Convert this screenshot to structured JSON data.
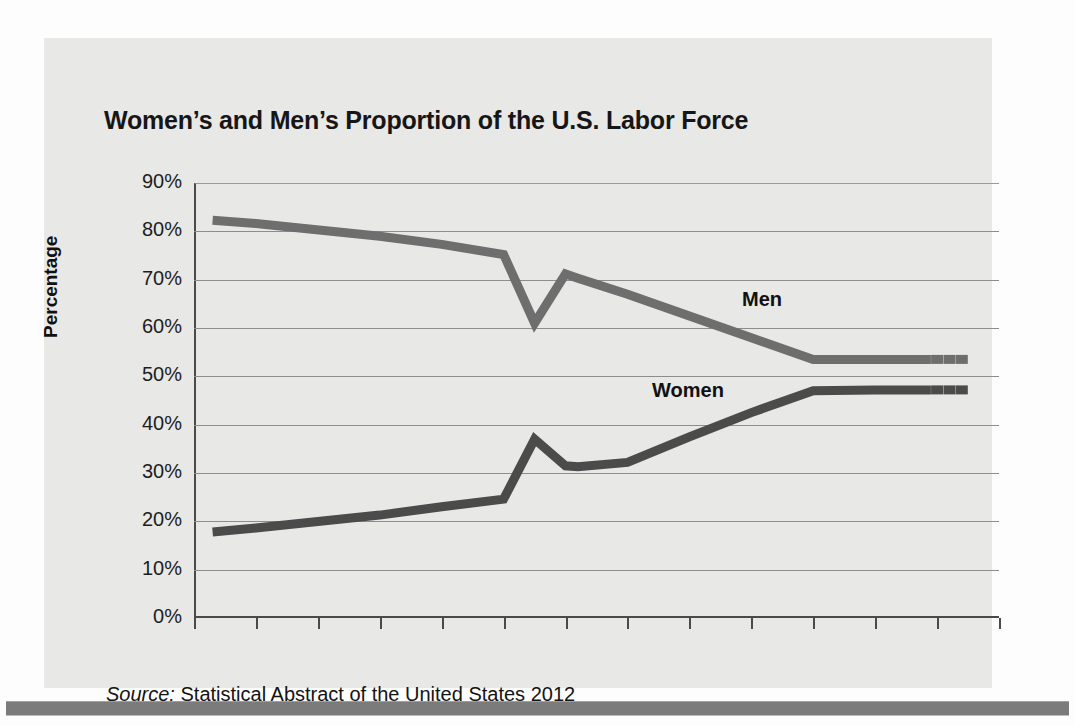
{
  "chart_data": {
    "type": "line",
    "title": "Women’s and Men’s Proportion of the U.S. Labor Force",
    "xlabel": "Year",
    "ylabel": "Percentage",
    "xlim": [
      1890,
      2020
    ],
    "ylim": [
      0,
      90
    ],
    "grid": true,
    "legend_position": "inline-annotation",
    "x_tick_labels": [
      "1890",
      "1900",
      "1910",
      "1920",
      "1930",
      "1940",
      "1950",
      "1960",
      "1970",
      "1980",
      "1990",
      "2000",
      "2010",
      "2020"
    ],
    "x_ticks": [
      1890,
      1900,
      1910,
      1920,
      1930,
      1940,
      1950,
      1960,
      1970,
      1980,
      1990,
      2000,
      2010,
      2020
    ],
    "y_tick_labels": [
      "0%",
      "10%",
      "20%",
      "30%",
      "40%",
      "50%",
      "60%",
      "70%",
      "80%",
      "90%"
    ],
    "y_ticks": [
      0,
      10,
      20,
      30,
      40,
      50,
      60,
      70,
      80,
      90
    ],
    "series": [
      {
        "name": "Men",
        "color": "#6e6e6e",
        "x": [
          1893,
          1900,
          1920,
          1930,
          1940,
          1945,
          1950,
          1952,
          1960,
          1970,
          1980,
          1990,
          2000,
          2009
        ],
        "values": [
          82.3,
          81.6,
          79.0,
          77.3,
          75.2,
          61.0,
          71.2,
          70.3,
          67.0,
          62.5,
          58.0,
          53.5,
          53.5,
          53.5
        ],
        "projected_x": [
          2010,
          2012,
          2014
        ],
        "projected_values": [
          53.5,
          53.5,
          53.5
        ]
      },
      {
        "name": "Women",
        "color": "#4b4b4b",
        "x": [
          1893,
          1900,
          1920,
          1930,
          1940,
          1945,
          1950,
          1952,
          1960,
          1970,
          1980,
          1990,
          2000,
          2009
        ],
        "values": [
          17.8,
          18.6,
          21.3,
          23.0,
          24.6,
          37.0,
          31.5,
          31.3,
          32.2,
          37.5,
          42.5,
          47.0,
          47.2,
          47.2
        ],
        "projected_x": [
          2010,
          2012,
          2014
        ],
        "projected_values": [
          47.2,
          47.2,
          47.2
        ]
      }
    ],
    "annotations": [
      {
        "text": "Men",
        "series": "Men"
      },
      {
        "text": "Women",
        "series": "Women"
      }
    ]
  },
  "source": {
    "label": "Source:",
    "text": "Statistical Abstract of the United States 2012"
  }
}
